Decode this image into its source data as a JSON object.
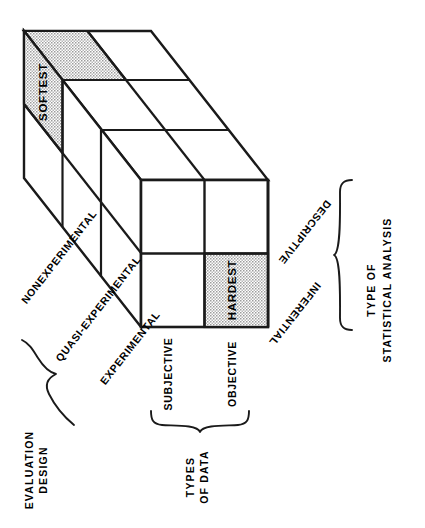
{
  "figure": {
    "kind": "3d-cube-taxonomy-diagram",
    "background_color": "#ffffff",
    "line_color": "#1a1a1a",
    "shade_color": "#c9c9c9"
  },
  "cells": {
    "softest": {
      "label": "SOFTEST",
      "shaded": true
    },
    "hardest": {
      "label": "HARDEST",
      "shaded": true
    }
  },
  "axes": {
    "evaluation_design": {
      "group_label_line1": "EVALUATION",
      "group_label_line2": "DESIGN",
      "items": [
        {
          "label": "NONEXPERIMENTAL"
        },
        {
          "label": "QUASI-EXPERIMENTAL"
        },
        {
          "label": "EXPERIMENTAL"
        }
      ]
    },
    "types_of_data": {
      "group_label_line1": "TYPES",
      "group_label_line2": "OF DATA",
      "items": [
        {
          "label": "SUBJECTIVE"
        },
        {
          "label": "OBJECTIVE"
        }
      ]
    },
    "type_of_statistical_analysis": {
      "group_label_line1": "TYPE OF",
      "group_label_line2": "STATISTICAL ANALYSIS",
      "items": [
        {
          "label": "DESCRIPTIVE"
        },
        {
          "label": "INFERENTIAL"
        }
      ]
    }
  }
}
